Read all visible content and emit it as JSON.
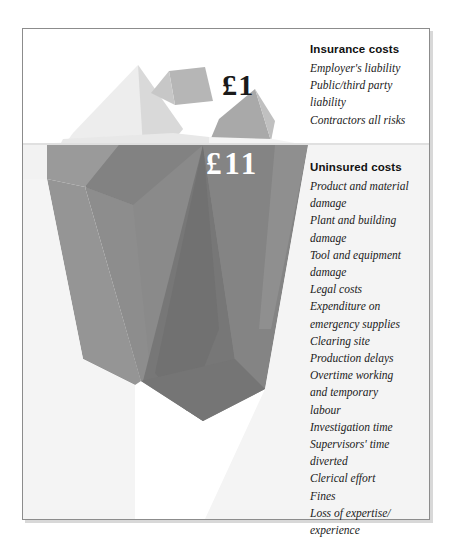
{
  "figure": {
    "frame_color": "#8c8c8c",
    "background_color": "#ffffff"
  },
  "labels": {
    "above_water_amount": "£1",
    "below_water_amount": "£11",
    "above_water_amount_color": "#1a1a1a",
    "below_water_amount_color": "#ffffff"
  },
  "insurance": {
    "heading": "Insurance costs",
    "items": [
      "Employer's liability",
      "Public/third party\nliability",
      "Contractors all risks"
    ]
  },
  "uninsured": {
    "heading": "Uninsured costs",
    "items": [
      "Product and material\ndamage",
      "Plant and building\ndamage",
      "Tool and equipment\ndamage",
      "Legal costs",
      "Expenditure on\nemergency supplies",
      "Clearing site",
      "Production delays",
      "Overtime working\nand temporary\nlabour",
      "Investigation time",
      "Supervisors' time\ndiverted",
      "Clerical effort",
      "Fines",
      "Loss of expertise/\nexperience"
    ]
  },
  "iceberg": {
    "above_water_colors": [
      "#f2f2f2",
      "#e3e3e3",
      "#d2d2d2",
      "#b9b9b9",
      "#a8a8a8"
    ],
    "below_water_colors": [
      "#8e8e8e",
      "#7f7f7f",
      "#747474",
      "#6e6e6e",
      "#979797"
    ],
    "waterline_y": 143
  }
}
